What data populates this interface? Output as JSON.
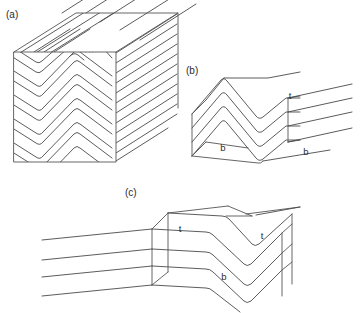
{
  "figure": {
    "background_color": "#ffffff",
    "line_color": "#4a4a4a",
    "text_color": "#2b2b2b",
    "width": 363,
    "height": 313
  },
  "panels": [
    {
      "id": "a",
      "label": "(a)",
      "label_x": 6,
      "label_y": 18,
      "description": "Cube block diagram with chevron folded layers; folded bedding traces on front face, layer traces on top and right faces extending beyond the block",
      "surface_labels": []
    },
    {
      "id": "b",
      "label": "(b)",
      "label_x": 186,
      "label_y": 74,
      "description": "Single folded bedding surface, antiform-synform pair, viewed obliquely",
      "surface_labels": [
        {
          "text": "t",
          "x": 290,
          "y": 99
        },
        {
          "text": "b",
          "x": 223,
          "y": 151
        },
        {
          "text": "b",
          "x": 306,
          "y": 155
        }
      ]
    },
    {
      "id": "c",
      "label": "(c)",
      "label_x": 125,
      "label_y": 196,
      "description": "Layered block with chevron fold; top surface labelled t on both limbs and bottom surface labelled b in the synform core",
      "surface_labels": [
        {
          "text": "t",
          "x": 180,
          "y": 232
        },
        {
          "text": "t",
          "x": 262,
          "y": 239
        },
        {
          "text": "b",
          "x": 224,
          "y": 280
        }
      ]
    }
  ]
}
